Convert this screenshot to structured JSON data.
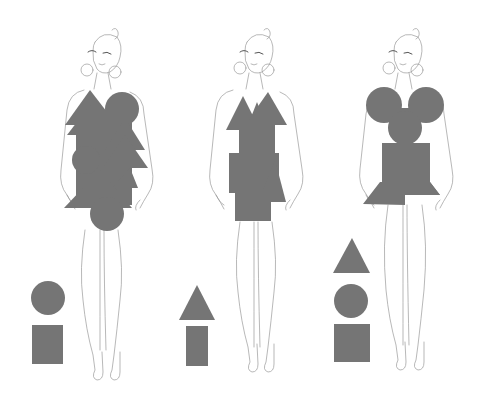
{
  "figure": {
    "shape_color": "#757575",
    "line_color": "#9a9a9a",
    "background": "#ffffff"
  },
  "models": [
    {
      "id": "model-1",
      "center_x": 103,
      "dress_shapes": [
        "triangle",
        "circle",
        "triangle-stack",
        "circle"
      ],
      "legend": [
        {
          "shape": "circle",
          "cx": 48,
          "cy": 298,
          "r": 17
        },
        {
          "shape": "rectangle",
          "x": 32,
          "y": 325,
          "w": 31,
          "h": 39
        }
      ]
    },
    {
      "id": "model-2",
      "center_x": 255,
      "dress_shapes": [
        "triangle",
        "triangle",
        "triangle",
        "rectangle",
        "rectangle"
      ],
      "legend": [
        {
          "shape": "triangle",
          "points": "197,285 179,320 215,320"
        },
        {
          "shape": "rectangle",
          "x": 186,
          "y": 326,
          "w": 22,
          "h": 40
        }
      ]
    },
    {
      "id": "model-3",
      "center_x": 404,
      "dress_shapes": [
        "circle",
        "circle",
        "circle",
        "rectangle",
        "trapezoid"
      ],
      "legend": [
        {
          "shape": "triangle",
          "points": "352,238 333,273 370,273"
        },
        {
          "shape": "circle",
          "cx": 351,
          "cy": 301,
          "r": 17
        },
        {
          "shape": "rectangle",
          "x": 334,
          "y": 324,
          "w": 36,
          "h": 38
        }
      ]
    }
  ]
}
